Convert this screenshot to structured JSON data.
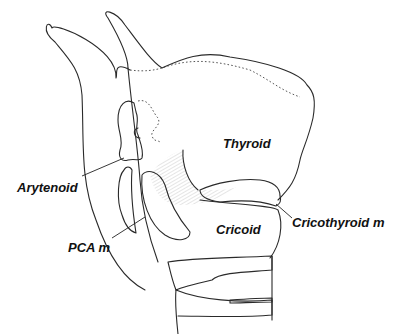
{
  "figure": {
    "labels": {
      "thyroid": "Thyroid",
      "arytenoid": "Arytenoid",
      "cricoid": "Cricoid",
      "pca": "PCA m",
      "cricothyroid": "Cricothyroid m"
    }
  }
}
